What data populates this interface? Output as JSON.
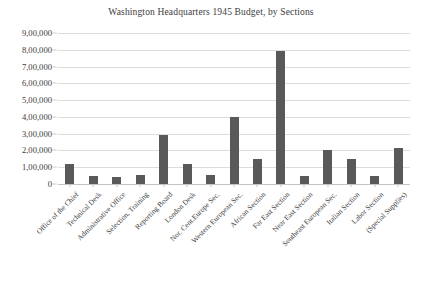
{
  "chart_data": {
    "type": "bar",
    "title": "Washington Headquarters 1945 Budget, by Sections",
    "xlabel": "",
    "ylabel": "",
    "ylim": [
      0,
      900000
    ],
    "ytick_step": 100000,
    "grid": true,
    "legend": null,
    "number_format": "indian-lakh",
    "bar_color": "#595959",
    "gridline_color": "#dcdcdc",
    "axis_color": "#c4c4c4",
    "text_color": "#3b3b3b",
    "ytick_labels": [
      "9,00,000",
      "8,00,000",
      "7,00,000",
      "6,00,000",
      "5,00,000",
      "4,00,000",
      "3,00,000",
      "2,00,000",
      "1,00,000",
      "0"
    ],
    "ytick_values": [
      900000,
      800000,
      700000,
      600000,
      500000,
      400000,
      300000,
      200000,
      100000,
      0
    ],
    "categories": [
      "Office of the Chief",
      "Technical Desk",
      "Administrative Office",
      "Selection, Training",
      "Reporting Board",
      "London Desk",
      "Nor. Cent.Europe Sec.",
      "Western European Sec.",
      "African Section",
      "Far East Section",
      "Near East Section",
      "Southeast European Sec.",
      "Italian Section",
      "Labor Section",
      "(Special Supplies)"
    ],
    "values": [
      120000,
      50000,
      40000,
      55000,
      290000,
      120000,
      55000,
      400000,
      150000,
      790000,
      50000,
      200000,
      150000,
      45000,
      215000
    ]
  }
}
